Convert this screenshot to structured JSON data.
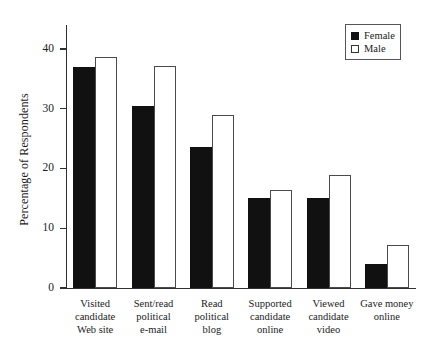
{
  "chart_data": {
    "type": "bar",
    "title": "",
    "xlabel": "",
    "ylabel": "Percentage of Respondents",
    "ylim": [
      0,
      44
    ],
    "yticks": [
      0,
      10,
      20,
      30,
      40
    ],
    "ytick_labels": [
      "0",
      "10",
      "20",
      "30",
      "40"
    ],
    "grid": false,
    "legend_position": "top-right",
    "categories": [
      "Visited\ncandidate\nWeb site",
      "Sent/read\npolitical\ne-mail",
      "Read\npolitical\nblog",
      "Supported\ncandidate\nonline",
      "Viewed\ncandidate\nvideo",
      "Gave money\nonline"
    ],
    "series": [
      {
        "name": "Female",
        "color": "#111111",
        "values": [
          37.0,
          30.5,
          23.6,
          15.1,
          15.1,
          4.1
        ]
      },
      {
        "name": "Male",
        "color": "#ffffff",
        "values": [
          38.7,
          37.2,
          28.9,
          16.4,
          18.9,
          7.2
        ]
      }
    ]
  },
  "legend": {
    "items": [
      {
        "label": "Female",
        "style": "female"
      },
      {
        "label": "Male",
        "style": "male"
      }
    ]
  }
}
